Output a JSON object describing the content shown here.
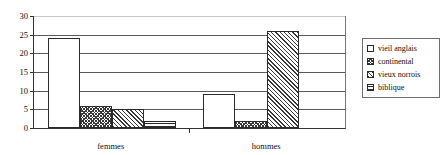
{
  "chart_data": {
    "type": "bar",
    "title": "",
    "xlabel": "",
    "ylabel": "",
    "categories": [
      "femmes",
      "hommes"
    ],
    "series": [
      {
        "name": "vieil anglais",
        "values": [
          24,
          9
        ],
        "pattern": "plain"
      },
      {
        "name": "continental",
        "values": [
          6,
          2
        ],
        "pattern": "cross"
      },
      {
        "name": "vieux norrois",
        "values": [
          5,
          26
        ],
        "pattern": "diagonal"
      },
      {
        "name": "biblique",
        "values": [
          2,
          0
        ],
        "pattern": "horizontal"
      }
    ],
    "ylim": [
      0,
      30
    ],
    "yticks": [
      0,
      5,
      10,
      15,
      20,
      25,
      30
    ],
    "ytick_labels": [
      "0",
      "5",
      "10",
      "15",
      "20",
      "25",
      "30"
    ],
    "grid": true,
    "grid_axis": "y",
    "legend_position": "right",
    "legend_entries": [
      "vieil anglais",
      "continental",
      "vieux norrois",
      "biblique"
    ]
  },
  "colors": {
    "axis": "#333333",
    "gridline": "#5a5a5a",
    "bar_outline": "#2b2b2b",
    "hatch": "#3a3a3a",
    "background": "#ffffff",
    "legend_border": "#6e6e6e"
  }
}
